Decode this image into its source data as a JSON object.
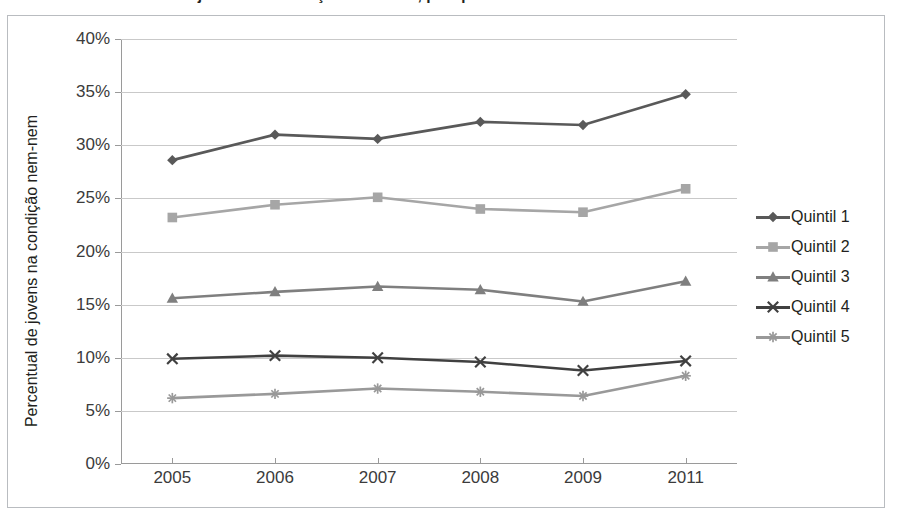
{
  "title": "Gráfico – Percentual de jovens na condição nem-nem, por quintil de renda",
  "y_axis_title": "Percentual de jovens na condição nem-nem",
  "legend": {
    "position": "right",
    "entries": [
      {
        "label": "Quintil 1",
        "marker": "diamond-marker",
        "color": "#595959"
      },
      {
        "label": "Quintil 2",
        "marker": "square-marker",
        "color": "#a6a6a6"
      },
      {
        "label": "Quintil 3",
        "marker": "triangle-marker",
        "color": "#7f7f7f"
      },
      {
        "label": "Quintil 4",
        "marker": "x-marker",
        "color": "#404040"
      },
      {
        "label": "Quintil 5",
        "marker": "star-marker",
        "color": "#999999"
      }
    ]
  },
  "chart_data": {
    "type": "line",
    "title": "Gráfico – Percentual de jovens na condição nem-nem, por quintil de renda",
    "xlabel": "",
    "ylabel": "Percentual de jovens na condição nem-nem",
    "categories": [
      "2005",
      "2006",
      "2007",
      "2008",
      "2009",
      "2011"
    ],
    "ylim": [
      0,
      40
    ],
    "ytick_step": 5,
    "ytick_labels": [
      "0%",
      "5%",
      "10%",
      "15%",
      "20%",
      "25%",
      "30%",
      "35%",
      "40%"
    ],
    "ytick_values": [
      0,
      5,
      10,
      15,
      20,
      25,
      30,
      35,
      40
    ],
    "grid": true,
    "grid_axis": "y",
    "legend_position": "right",
    "value_suffix": "%",
    "series": [
      {
        "name": "Quintil 1",
        "marker": "diamond",
        "color": "#595959",
        "values": [
          28.6,
          31.0,
          30.6,
          32.2,
          31.9,
          34.8
        ]
      },
      {
        "name": "Quintil 2",
        "marker": "square",
        "color": "#a6a6a6",
        "values": [
          23.2,
          24.4,
          25.1,
          24.0,
          23.7,
          25.9
        ]
      },
      {
        "name": "Quintil 3",
        "marker": "triangle",
        "color": "#7f7f7f",
        "values": [
          15.6,
          16.2,
          16.7,
          16.4,
          15.3,
          17.2
        ]
      },
      {
        "name": "Quintil 4",
        "marker": "x",
        "color": "#404040",
        "values": [
          9.9,
          10.2,
          10.0,
          9.6,
          8.8,
          9.7
        ]
      },
      {
        "name": "Quintil 5",
        "marker": "star",
        "color": "#999999",
        "values": [
          6.2,
          6.6,
          7.1,
          6.8,
          6.4,
          8.3
        ]
      }
    ]
  }
}
